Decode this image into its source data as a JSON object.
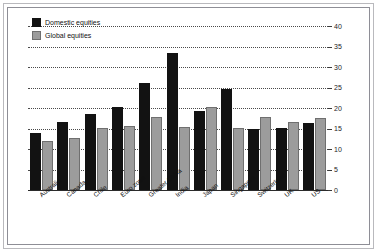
{
  "chart_data": {
    "type": "bar",
    "title": "",
    "xlabel": "",
    "ylabel": "",
    "ylim": [
      0,
      40
    ],
    "yticks": [
      0,
      5,
      10,
      15,
      20,
      25,
      30,
      35,
      40
    ],
    "grid": true,
    "legend_position": "top-left",
    "axis_side": "right",
    "categories": [
      "Australia",
      "Canada",
      "Chile",
      "Euro zone",
      "Greater China",
      "India",
      "Japan",
      "Singapore",
      "Switzerland",
      "UK",
      "US"
    ],
    "series": [
      {
        "name": "Domestic equities",
        "color": "#121212",
        "values": [
          14.0,
          16.7,
          18.5,
          20.2,
          26.0,
          33.5,
          19.3,
          24.7,
          15.0,
          15.2,
          16.3
        ]
      },
      {
        "name": "Global equities",
        "color": "#9c9c9c",
        "values": [
          12.0,
          12.6,
          15.1,
          15.6,
          17.8,
          15.3,
          20.3,
          15.1,
          17.9,
          16.5,
          17.5
        ]
      }
    ]
  },
  "legend": {
    "items": [
      {
        "label": "Domestic equities",
        "swatch": "domestic"
      },
      {
        "label": "Global equities",
        "swatch": "global"
      }
    ]
  }
}
